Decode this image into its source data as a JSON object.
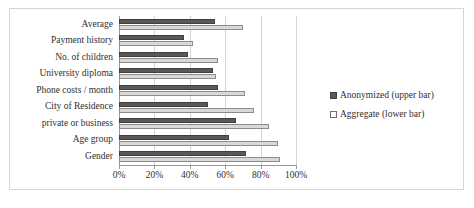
{
  "chart_data": {
    "type": "bar",
    "orientation": "horizontal",
    "title": "",
    "xlabel": "",
    "ylabel": "",
    "xlim": [
      0,
      100
    ],
    "x_tick_labels": [
      "0%",
      "20%",
      "40%",
      "60%",
      "80%",
      "100%"
    ],
    "x_tick_values": [
      0,
      20,
      40,
      60,
      80,
      100
    ],
    "grid": true,
    "legend_position": "right",
    "categories": [
      "Average",
      "Payment history",
      "No. of children",
      "University diploma",
      "Phone costs / month",
      "City of Residence",
      "private or business",
      "Age group",
      "Gender"
    ],
    "series": [
      {
        "name": "Anonymized (upper bar)",
        "color": "#595959",
        "values": [
          54,
          37,
          39,
          53,
          56,
          50,
          66,
          62,
          72
        ]
      },
      {
        "name": "Aggregate (lower bar)",
        "color": "#d9d9d9",
        "values": [
          70,
          42,
          56,
          55,
          71,
          76,
          85,
          90,
          91
        ]
      }
    ]
  },
  "legend": {
    "entries": [
      {
        "label": "Anonymized (upper bar)",
        "swatch": "anonymized"
      },
      {
        "label": "Aggregate (lower bar)",
        "swatch": "aggregate"
      }
    ]
  }
}
